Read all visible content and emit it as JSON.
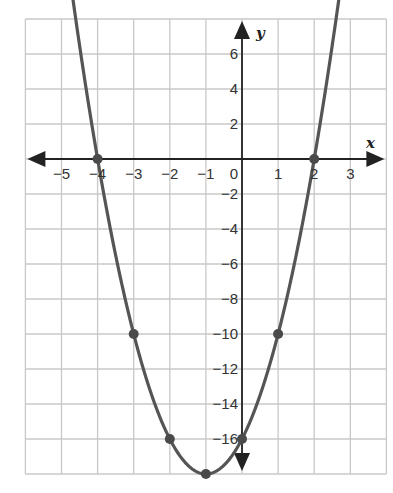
{
  "chart_data": {
    "type": "line",
    "title": "",
    "equation": "y = 2x^2 + 4x - 16",
    "xlabel": "x",
    "ylabel": "y",
    "xlim": [
      -6,
      4
    ],
    "ylim": [
      -18,
      8
    ],
    "grid": true,
    "x_ticks": [
      -5,
      -4,
      -3,
      -2,
      -1,
      0,
      1,
      2,
      3
    ],
    "x_tick_labels": [
      "−5",
      "−4",
      "−3",
      "−2",
      "−1",
      "0",
      "1",
      "2",
      "3"
    ],
    "y_ticks": [
      6,
      4,
      2,
      -2,
      -4,
      -6,
      -8,
      -10,
      -12,
      -14,
      -16
    ],
    "y_tick_labels": [
      "6",
      "4",
      "2",
      "−2",
      "−4",
      "−6",
      "−8",
      "−10",
      "−12",
      "−14",
      "−16"
    ],
    "series": [
      {
        "name": "parabola",
        "color": "#555555",
        "points": [
          {
            "x": -4,
            "y": 0
          },
          {
            "x": -3,
            "y": -10
          },
          {
            "x": -2,
            "y": -16
          },
          {
            "x": -1,
            "y": -18
          },
          {
            "x": 0,
            "y": -16
          },
          {
            "x": 1,
            "y": -10
          },
          {
            "x": 2,
            "y": 0
          }
        ]
      }
    ]
  },
  "colors": {
    "grid": "#c8c8c8",
    "axis": "#222222",
    "curve": "#555555",
    "point": "#4a4a4a"
  }
}
